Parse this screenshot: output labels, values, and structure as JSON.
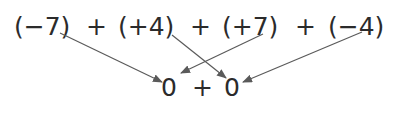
{
  "diagram": {
    "top_row": {
      "terms": [
        {
          "text": "(−7)",
          "x": 14
        },
        {
          "text": "+",
          "x": 86
        },
        {
          "text": "(+4)",
          "x": 118
        },
        {
          "text": "+",
          "x": 190
        },
        {
          "text": "(+7)",
          "x": 222
        },
        {
          "text": "+",
          "x": 295
        },
        {
          "text": "(−4)",
          "x": 328
        }
      ],
      "baseline_y": 35
    },
    "bottom_row": {
      "terms": [
        {
          "text": "0",
          "x": 161
        },
        {
          "text": "+",
          "x": 192
        },
        {
          "text": "0",
          "x": 224
        }
      ],
      "baseline_y": 96
    },
    "arrows": [
      {
        "from": "(−7)",
        "to": "first 0",
        "x1": 60,
        "y1": 33,
        "x2": 162,
        "y2": 82
      },
      {
        "from": "(+4)",
        "to": "second 0",
        "x1": 172,
        "y1": 35,
        "x2": 226,
        "y2": 78
      },
      {
        "from": "(+7)",
        "to": "first 0",
        "x1": 263,
        "y1": 34,
        "x2": 181,
        "y2": 73
      },
      {
        "from": "(−4)",
        "to": "second 0",
        "x1": 362,
        "y1": 32,
        "x2": 243,
        "y2": 82
      }
    ],
    "colors": {
      "text": "#2b2b2b",
      "arrow": "#5a5a5a"
    }
  }
}
